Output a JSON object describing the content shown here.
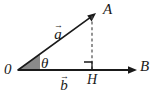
{
  "figure": {
    "background_color": "#ffffff",
    "stroke_color": "#1a1a1a",
    "wedge_fill_color": "#8a8a8a",
    "dash_color": "#4d4d4d",
    "labels": {
      "origin": "0",
      "angle": "θ",
      "point_a": "A",
      "point_b": "B",
      "foot_h": "H",
      "vector_a_glyph": "a",
      "vector_a_accent": "→",
      "vector_b_glyph": "b",
      "vector_b_accent": "→"
    },
    "geometry": {
      "origin_point": [
        18,
        70
      ],
      "vector_a_tip": [
        96,
        13
      ],
      "vector_b_tip": [
        137,
        70
      ],
      "foot_point": [
        92,
        70
      ],
      "dashed_top": [
        92,
        16
      ],
      "angle_arc_radius": 22,
      "right_angle_size": 8
    }
  }
}
